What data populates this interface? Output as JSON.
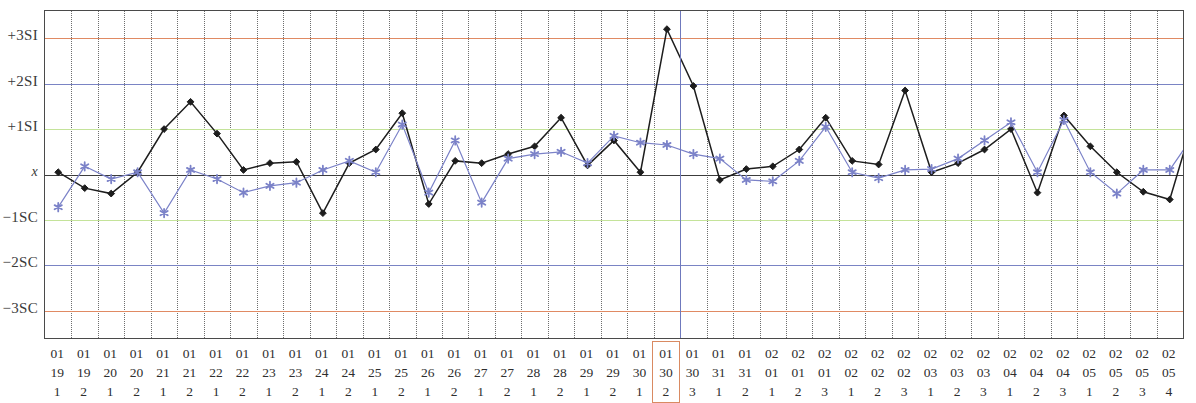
{
  "chart_data": {
    "type": "line",
    "title": "",
    "xlabel": "",
    "ylabel": "",
    "grid": true,
    "legend_position": "none",
    "ylim": [
      -3.6,
      3.6
    ],
    "y_tick_labels": [
      "+3SI",
      "+2SI",
      "+1SI",
      "x",
      "−1SC",
      "−2SC",
      "−3SC"
    ],
    "y_tick_values": [
      3,
      2,
      1,
      0,
      -1,
      -2,
      -3
    ],
    "reference_lines": [
      {
        "label": "+3SI",
        "value": 3,
        "color": "#e08a63"
      },
      {
        "label": "+2SI",
        "value": 2,
        "color": "#7a84c4"
      },
      {
        "label": "+1SI",
        "value": 1,
        "color": "#c4e39a"
      },
      {
        "label": "x",
        "value": 0,
        "color": "#3c3c3c"
      },
      {
        "label": "−1SC",
        "value": -1,
        "color": "#c4e39a"
      },
      {
        "label": "−2SC",
        "value": -2,
        "color": "#7a84c4"
      },
      {
        "label": "−3SC",
        "value": -3,
        "color": "#e08a63"
      }
    ],
    "x_tick_labels": [
      {
        "month": "01",
        "day": "19",
        "shift": "1"
      },
      {
        "month": "01",
        "day": "19",
        "shift": "2"
      },
      {
        "month": "01",
        "day": "20",
        "shift": "1"
      },
      {
        "month": "01",
        "day": "20",
        "shift": "2"
      },
      {
        "month": "01",
        "day": "21",
        "shift": "1"
      },
      {
        "month": "01",
        "day": "21",
        "shift": "2"
      },
      {
        "month": "01",
        "day": "22",
        "shift": "1"
      },
      {
        "month": "01",
        "day": "22",
        "shift": "2"
      },
      {
        "month": "01",
        "day": "23",
        "shift": "1"
      },
      {
        "month": "01",
        "day": "23",
        "shift": "2"
      },
      {
        "month": "01",
        "day": "24",
        "shift": "1"
      },
      {
        "month": "01",
        "day": "24",
        "shift": "2"
      },
      {
        "month": "01",
        "day": "25",
        "shift": "1"
      },
      {
        "month": "01",
        "day": "25",
        "shift": "2"
      },
      {
        "month": "01",
        "day": "26",
        "shift": "1"
      },
      {
        "month": "01",
        "day": "26",
        "shift": "2"
      },
      {
        "month": "01",
        "day": "27",
        "shift": "1"
      },
      {
        "month": "01",
        "day": "27",
        "shift": "2"
      },
      {
        "month": "01",
        "day": "28",
        "shift": "1"
      },
      {
        "month": "01",
        "day": "28",
        "shift": "2"
      },
      {
        "month": "01",
        "day": "29",
        "shift": "1"
      },
      {
        "month": "01",
        "day": "29",
        "shift": "2"
      },
      {
        "month": "01",
        "day": "30",
        "shift": "1"
      },
      {
        "month": "01",
        "day": "30",
        "shift": "2"
      },
      {
        "month": "01",
        "day": "30",
        "shift": "3"
      },
      {
        "month": "01",
        "day": "31",
        "shift": "1"
      },
      {
        "month": "01",
        "day": "31",
        "shift": "2"
      },
      {
        "month": "02",
        "day": "01",
        "shift": "1"
      },
      {
        "month": "02",
        "day": "01",
        "shift": "2"
      },
      {
        "month": "02",
        "day": "01",
        "shift": "3"
      },
      {
        "month": "02",
        "day": "02",
        "shift": "1"
      },
      {
        "month": "02",
        "day": "02",
        "shift": "2"
      },
      {
        "month": "02",
        "day": "02",
        "shift": "3"
      },
      {
        "month": "02",
        "day": "03",
        "shift": "1"
      },
      {
        "month": "02",
        "day": "03",
        "shift": "2"
      },
      {
        "month": "02",
        "day": "03",
        "shift": "3"
      },
      {
        "month": "02",
        "day": "04",
        "shift": "1"
      },
      {
        "month": "02",
        "day": "04",
        "shift": "2"
      },
      {
        "month": "02",
        "day": "04",
        "shift": "3"
      },
      {
        "month": "02",
        "day": "05",
        "shift": "1"
      },
      {
        "month": "02",
        "day": "05",
        "shift": "2"
      },
      {
        "month": "02",
        "day": "05",
        "shift": "3"
      },
      {
        "month": "02",
        "day": "05",
        "shift": "4"
      }
    ],
    "selected_index": 23,
    "selection_box_color": "#d98a62",
    "selection_line_color": "#6f79bd",
    "series": [
      {
        "name": "primary",
        "color": "#1d1d1d",
        "marker": "diamond",
        "values": [
          0.05,
          -0.3,
          -0.42,
          0.05,
          1.0,
          1.6,
          0.9,
          0.1,
          0.25,
          0.28,
          -0.85,
          0.25,
          0.55,
          1.35,
          -0.65,
          0.3,
          0.25,
          0.45,
          0.62,
          1.25,
          0.2,
          0.75,
          0.05,
          3.2,
          1.95,
          -0.12,
          0.12,
          0.18,
          0.55,
          1.25,
          0.3,
          0.22,
          1.85,
          0.05,
          0.25,
          0.55,
          1.0,
          -0.4,
          1.3,
          0.62,
          0.05,
          -0.38,
          -0.55,
          1.4
        ]
      },
      {
        "name": "secondary",
        "color": "#7b82c8",
        "marker": "star",
        "values": [
          -0.72,
          0.18,
          -0.1,
          0.05,
          -0.85,
          0.1,
          -0.1,
          -0.4,
          -0.25,
          -0.18,
          0.1,
          0.3,
          0.05,
          1.1,
          -0.4,
          0.75,
          -0.62,
          0.35,
          0.45,
          0.5,
          0.25,
          0.85,
          0.7,
          0.65,
          0.45,
          0.35,
          -0.12,
          -0.15,
          0.3,
          1.05,
          0.05,
          -0.08,
          0.1,
          0.12,
          0.35,
          0.75,
          1.15,
          0.05,
          1.2,
          0.05,
          -0.42,
          0.1,
          0.1,
          0.95
        ]
      }
    ]
  }
}
